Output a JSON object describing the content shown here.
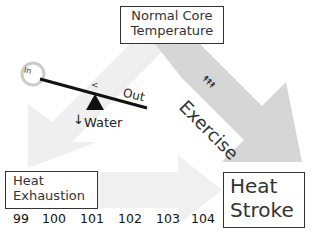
{
  "nodes": {
    "normal_core_temperature": {
      "line1": "Normal Core",
      "line2": "Temperature"
    },
    "heat_exhaustion": {
      "line1": "Heat",
      "line2": "Exhaustion"
    },
    "heat_stroke": {
      "line1": "Heat",
      "line2": "Stroke"
    }
  },
  "seesaw": {
    "in_label": "In",
    "comparison": "<",
    "out_label": "Out",
    "water_arrow": "↓",
    "water_label": "Water"
  },
  "exercise": {
    "icon": "↟↟↟",
    "label": "Exercise"
  },
  "temperature_scale": [
    "99",
    "100",
    "101",
    "102",
    "103",
    "104"
  ],
  "colors": {
    "light_arrow": "#efefef",
    "exercise_arrow": "#d6d6d6",
    "box_border": "#333333"
  }
}
